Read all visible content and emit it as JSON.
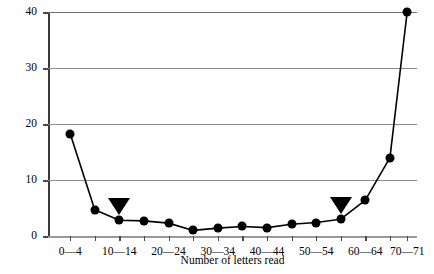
{
  "chart_data": {
    "type": "line",
    "title": "",
    "xlabel": "Number of letters read",
    "ylabel": "Percentage of young children",
    "xlim": [
      -2.5,
      72.5
    ],
    "ylim": [
      0,
      40
    ],
    "grid": true,
    "legend": null,
    "x_tick_labels": [
      "0—4",
      "10—14",
      "20—24",
      "30—34",
      "40—44",
      "50—54",
      "60—64",
      "70—71"
    ],
    "x_tick_values": [
      2,
      12,
      22,
      32,
      42,
      52,
      62,
      70.5
    ],
    "x_minor_tick_values": [
      2,
      7,
      12,
      17,
      22,
      27,
      32,
      37,
      42,
      47,
      52,
      57,
      62,
      67,
      70.5
    ],
    "y_tick_labels": [
      "0",
      "10",
      "20",
      "30",
      "40"
    ],
    "y_tick_values": [
      0,
      10,
      20,
      30,
      40
    ],
    "series": [
      {
        "name": "Percentage of young children",
        "marker": "filled-circle",
        "x": [
          2,
          7,
          12,
          17,
          22,
          27,
          32,
          37,
          42,
          47,
          52,
          57,
          62,
          67,
          70.5
        ],
        "values": [
          18.3,
          4.7,
          2.8,
          2.7,
          2.3,
          1.0,
          1.4,
          1.7,
          1.5,
          2.1,
          2.4,
          3.0,
          6.4,
          14.0,
          40.0
        ]
      }
    ],
    "annotations": [
      {
        "type": "down-triangle",
        "x": 12,
        "y": 2.8,
        "label": ""
      },
      {
        "type": "down-triangle",
        "x": 57,
        "y": 3.0,
        "label": ""
      }
    ]
  }
}
